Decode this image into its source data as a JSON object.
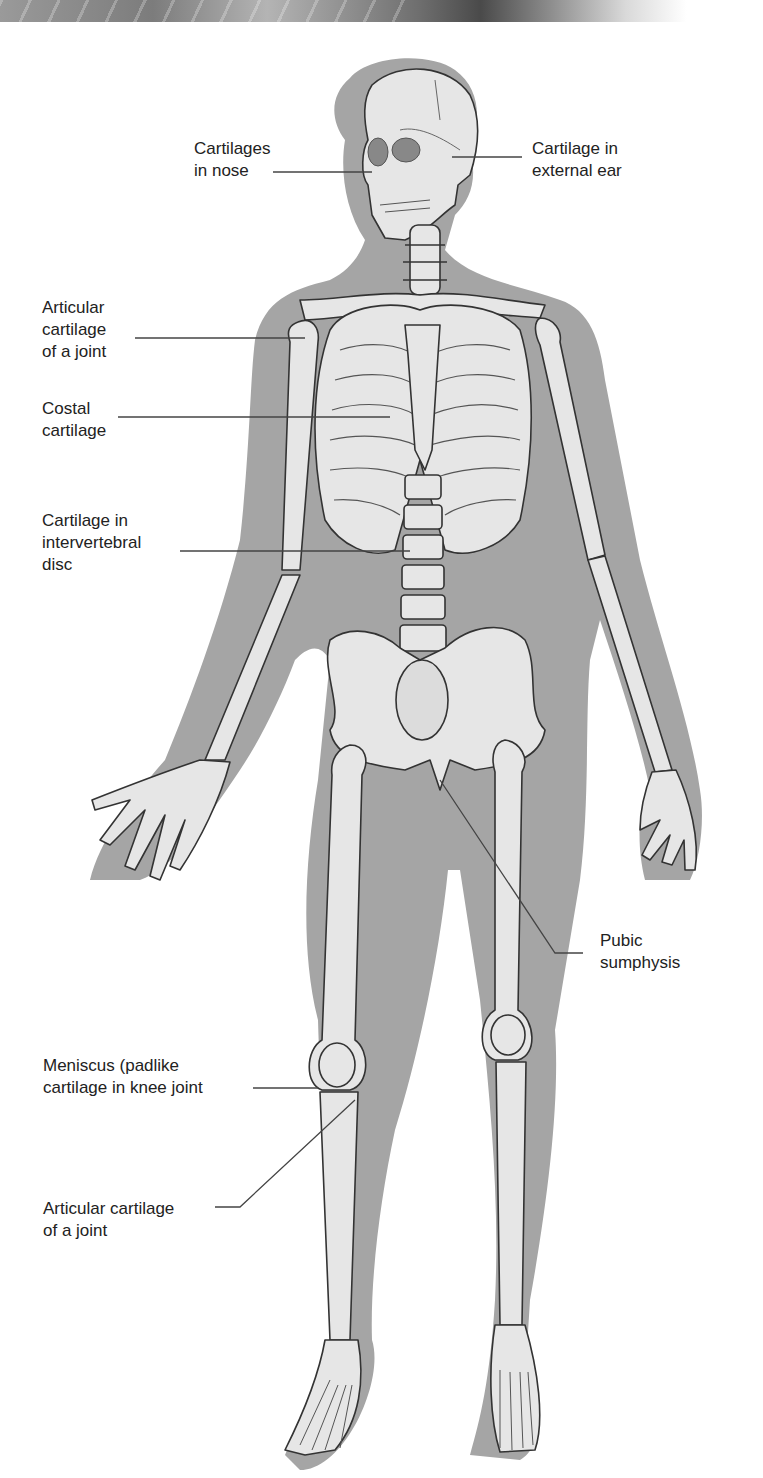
{
  "figure": {
    "colors": {
      "silhouette": "#a5a5a5",
      "bone_fill": "#e6e6e6",
      "bone_outline": "#333333",
      "leader_line": "#444444",
      "label_text": "#222222",
      "background": "#ffffff"
    }
  },
  "labels": [
    {
      "id": "nose",
      "text": "Cartilages\nin nose"
    },
    {
      "id": "ear",
      "text": "Cartilage in\nexternal ear"
    },
    {
      "id": "articular_shoulder",
      "text": "Articular\ncartilage\nof a joint"
    },
    {
      "id": "costal",
      "text": "Costal\ncartilage"
    },
    {
      "id": "intervertebral",
      "text": "Cartilage in\nintervertebral\ndisc"
    },
    {
      "id": "pubic",
      "text": "Pubic\nsumphysis"
    },
    {
      "id": "meniscus",
      "text": "Meniscus (padlike\ncartilage in knee joint"
    },
    {
      "id": "articular_knee",
      "text": "Articular cartilage\nof a joint"
    }
  ]
}
